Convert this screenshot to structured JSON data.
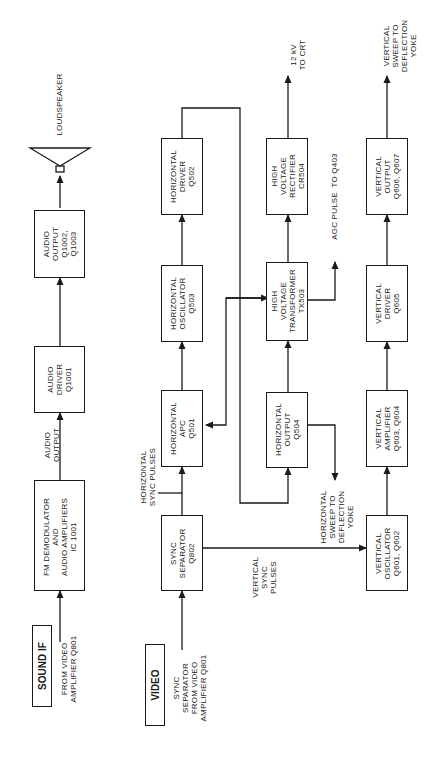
{
  "sections": {
    "sound_if": "SOUND IF",
    "video": "VIDEO"
  },
  "blocks": {
    "fm_demod": "FM DEMODULATOR\nAND\nAUDIO AMPLIFIERS\nIC 1001",
    "audio_driver": "AUDIO\nDRIVER\nQ1001",
    "audio_output": "AUDIO\nOUTPUT\nQ1002,\nQ1003",
    "sync_separator": "SYNC\nSEPARATOR\nQ802",
    "horizontal_apc": "HORIZONTAL\nAPC\nQ501",
    "horizontal_oscillator": "HORIZONTAL\nOSCILLATOR\nQ503",
    "horizontal_driver": "HORIZONTAL\nDRIVER\nQ502",
    "horizontal_output": "HORIZONTAL\nOUTPUT\nQ504",
    "hv_transformer": "HIGH\nVOLTAGE\nTRANSFORMER\nTX503",
    "hv_rectifier": "HIGH\nVOLTAGE\nRECTIFIER\nCR504",
    "vertical_oscillator": "VERTICAL\nOSCILLATOR\nQ601, Q602",
    "vertical_amplifier": "VERTICAL\nAMPLIFIER\nQ603, Q604",
    "vertical_driver": "VERTICAL\nDRIVER\nQ605",
    "vertical_output": "VERTICAL\nOUTPUT\nQ606, Q607"
  },
  "labels": {
    "from_video_amp_sound": "FROM VIDEO\nAMPLIFIER Q801",
    "audio_output_signal": "AUDIO\nOUTPUT",
    "loudspeaker": "LOUDSPEAKER",
    "sync_from_video_amp": "SYNC\nSEPARATOR\nFROM VIDEO\nAMPLIFIER Q801",
    "horizontal_sync_pulses": "HORIZONTAL\nSYNC PULSES",
    "vertical_sync_pulses": "VERTICAL\nSYNC\nPULSES",
    "horizontal_sweep": "HORIZONTAL\nSWEEP TO\nDEFLECTION\nYOKE",
    "agc_pulse": "AGC PULSE  TO Q403",
    "hv_to_crt": "12 kV\nTO CRT",
    "vertical_sweep": "VERTICAL\nSWEEP TO\nDEFLECTION\nYOKE"
  },
  "icons": {
    "speaker": "loudspeaker-icon"
  }
}
